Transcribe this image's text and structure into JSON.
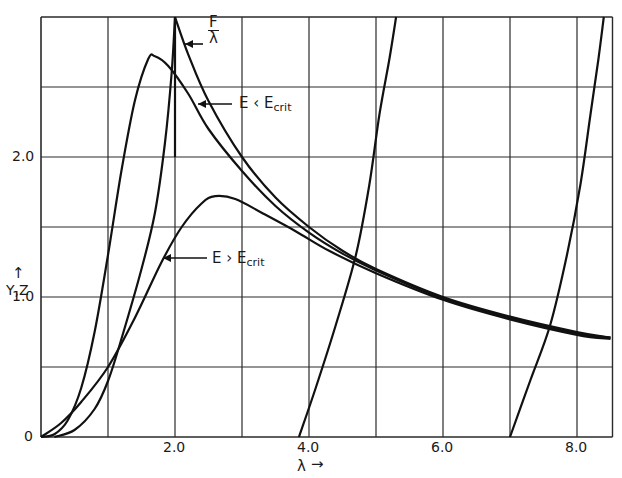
{
  "chart_data": {
    "type": "line",
    "title": "",
    "xlabel": "λ →",
    "ylabel": "↑ Y,Z",
    "xlim": [
      0,
      8.5
    ],
    "ylim": [
      0,
      3.0
    ],
    "grid": true,
    "x_gridlines": [
      1,
      2,
      3,
      4,
      5,
      6,
      7,
      8
    ],
    "y_gridlines": [
      0.5,
      1.0,
      1.5,
      2.0,
      2.5
    ],
    "x_tick_labels": [
      {
        "x": 2,
        "label": "2.0"
      },
      {
        "x": 4,
        "label": "4.0"
      },
      {
        "x": 6,
        "label": "6.0"
      },
      {
        "x": 8,
        "label": "8.0"
      }
    ],
    "y_tick_labels": [
      {
        "y": 0,
        "label": "0"
      },
      {
        "y": 1,
        "label": "1.0"
      },
      {
        "y": 2,
        "label": "2.0"
      }
    ],
    "series": [
      {
        "name": "F/λ",
        "points": [
          [
            2.0,
            3.0
          ],
          [
            2.2,
            2.73
          ],
          [
            2.5,
            2.4
          ],
          [
            3.0,
            2.0
          ],
          [
            3.5,
            1.71
          ],
          [
            4.0,
            1.5
          ],
          [
            4.5,
            1.33
          ],
          [
            5.0,
            1.2
          ],
          [
            6.0,
            1.0
          ],
          [
            7.0,
            0.86
          ],
          [
            8.0,
            0.75
          ],
          [
            8.5,
            0.71
          ]
        ]
      },
      {
        "name": "E < E_crit",
        "points": [
          [
            0.0,
            0.0
          ],
          [
            0.2,
            0.02
          ],
          [
            0.4,
            0.12
          ],
          [
            0.6,
            0.35
          ],
          [
            0.8,
            0.75
          ],
          [
            1.0,
            1.3
          ],
          [
            1.2,
            1.9
          ],
          [
            1.4,
            2.4
          ],
          [
            1.6,
            2.7
          ],
          [
            1.7,
            2.72
          ],
          [
            1.9,
            2.65
          ],
          [
            2.2,
            2.45
          ],
          [
            2.5,
            2.2
          ],
          [
            3.0,
            1.9
          ],
          [
            3.5,
            1.65
          ],
          [
            4.0,
            1.46
          ],
          [
            4.5,
            1.31
          ],
          [
            5.0,
            1.19
          ],
          [
            6.0,
            0.99
          ],
          [
            7.0,
            0.85
          ],
          [
            8.0,
            0.74
          ],
          [
            8.5,
            0.71
          ]
        ]
      },
      {
        "name": "E > E_crit",
        "points": [
          [
            0.0,
            0.0
          ],
          [
            0.3,
            0.1
          ],
          [
            0.6,
            0.25
          ],
          [
            1.0,
            0.5
          ],
          [
            1.4,
            0.85
          ],
          [
            1.8,
            1.25
          ],
          [
            2.1,
            1.5
          ],
          [
            2.4,
            1.67
          ],
          [
            2.6,
            1.72
          ],
          [
            2.9,
            1.7
          ],
          [
            3.3,
            1.6
          ],
          [
            3.8,
            1.47
          ],
          [
            4.3,
            1.33
          ],
          [
            5.0,
            1.17
          ],
          [
            6.0,
            0.98
          ],
          [
            7.0,
            0.84
          ],
          [
            8.0,
            0.73
          ],
          [
            8.5,
            0.7
          ]
        ]
      },
      {
        "name": "Z branch 1",
        "points": [
          [
            0.2,
            0.0
          ],
          [
            0.5,
            0.05
          ],
          [
            0.8,
            0.2
          ],
          [
            1.0,
            0.4
          ],
          [
            1.2,
            0.7
          ],
          [
            1.5,
            1.2
          ],
          [
            1.7,
            1.6
          ],
          [
            1.85,
            2.1
          ],
          [
            1.95,
            2.6
          ],
          [
            2.0,
            3.0
          ]
        ]
      },
      {
        "name": "Z branch 2",
        "points": [
          [
            3.85,
            0.0
          ],
          [
            4.1,
            0.35
          ],
          [
            4.4,
            0.8
          ],
          [
            4.7,
            1.3
          ],
          [
            4.9,
            1.8
          ],
          [
            5.05,
            2.3
          ],
          [
            5.2,
            2.7
          ],
          [
            5.3,
            3.0
          ]
        ]
      },
      {
        "name": "Z branch 3",
        "points": [
          [
            7.0,
            0.0
          ],
          [
            7.3,
            0.4
          ],
          [
            7.6,
            0.8
          ],
          [
            7.85,
            1.3
          ],
          [
            8.05,
            1.8
          ],
          [
            8.2,
            2.3
          ],
          [
            8.32,
            2.7
          ],
          [
            8.4,
            3.0
          ]
        ]
      }
    ],
    "annotations": [
      {
        "text": "F",
        "sub": "",
        "denominator": "λ",
        "target": "F/λ",
        "at": [
          2.1,
          2.85
        ]
      },
      {
        "text": "E < E",
        "sub": "crit",
        "target": "E < E_crit",
        "at": [
          2.0,
          2.22
        ]
      },
      {
        "text": "E > E",
        "sub": "crit",
        "target": "E > E_crit",
        "at": [
          1.5,
          1.45
        ]
      }
    ]
  },
  "labels": {
    "x_axis": "λ",
    "x_arrow": "→",
    "y_axis": "Y,Z",
    "y_arrow": "↑",
    "f_num": "F",
    "f_den": "λ",
    "e_less": "E ‹ E",
    "e_more": "E › E",
    "crit": "crit"
  }
}
